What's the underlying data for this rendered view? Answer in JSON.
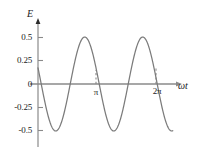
{
  "chart_data": {
    "type": "line",
    "title": "",
    "xlabel": "ωt",
    "ylabel": "E",
    "xlim": [
      0,
      7.3
    ],
    "ylim": [
      -0.62,
      0.62
    ],
    "grid": false,
    "legend": null,
    "x_ticks": [
      {
        "value": 3.14159,
        "label": "π"
      },
      {
        "value": 6.28319,
        "label": "2π"
      }
    ],
    "y_ticks": [
      {
        "value": 0.5,
        "label": "0.5"
      },
      {
        "value": 0.25,
        "label": "0.25"
      },
      {
        "value": 0.0,
        "label": "0"
      },
      {
        "value": -0.25,
        "label": "-0.25"
      },
      {
        "value": -0.5,
        "label": "-0.5"
      }
    ],
    "series": [
      {
        "name": "E",
        "color": "#7b7b7b",
        "amplitude": 0.5,
        "cycles": 2,
        "phase": -0.35,
        "expression": "E = -0.5 * sin(2*wt - 0.35)",
        "points": [
          {
            "x": 0.0,
            "y": 0.172
          },
          {
            "x": 0.1,
            "y": 0.069
          },
          {
            "x": 0.17,
            "y": 0.0
          },
          {
            "x": 0.3,
            "y": -0.126
          },
          {
            "x": 0.5,
            "y": -0.303
          },
          {
            "x": 0.7,
            "y": -0.428
          },
          {
            "x": 0.95,
            "y": -0.497
          },
          {
            "x": 1.0,
            "y": -0.5
          },
          {
            "x": 1.2,
            "y": -0.48
          },
          {
            "x": 1.4,
            "y": -0.404
          },
          {
            "x": 1.6,
            "y": -0.283
          },
          {
            "x": 1.75,
            "y": -0.166
          },
          {
            "x": 1.75,
            "y": -0.16
          },
          {
            "x": 1.92,
            "y": 0.0
          },
          {
            "x": 2.1,
            "y": 0.154
          },
          {
            "x": 2.3,
            "y": 0.304
          },
          {
            "x": 2.5,
            "y": 0.412
          },
          {
            "x": 2.75,
            "y": 0.489
          },
          {
            "x": 2.93,
            "y": 0.5
          },
          {
            "x": 3.1,
            "y": 0.485
          },
          {
            "x": 3.3,
            "y": 0.424
          },
          {
            "x": 3.5,
            "y": 0.319
          },
          {
            "x": 3.7,
            "y": 0.181
          },
          {
            "x": 3.9,
            "y": 0.025
          },
          {
            "x": 3.93,
            "y": 0.0
          },
          {
            "x": 4.1,
            "y": -0.135
          },
          {
            "x": 4.3,
            "y": -0.285
          },
          {
            "x": 4.5,
            "y": -0.401
          },
          {
            "x": 4.75,
            "y": -0.483
          },
          {
            "x": 4.93,
            "y": -0.5
          },
          {
            "x": 5.1,
            "y": -0.49
          },
          {
            "x": 5.3,
            "y": -0.437
          },
          {
            "x": 5.5,
            "y": -0.34
          },
          {
            "x": 5.7,
            "y": -0.207
          },
          {
            "x": 5.88,
            "y": -0.06
          },
          {
            "x": 5.93,
            "y": 0.0
          },
          {
            "x": 6.1,
            "y": 0.15
          },
          {
            "x": 6.3,
            "y": 0.3
          },
          {
            "x": 6.5,
            "y": 0.41
          },
          {
            "x": 6.75,
            "y": 0.487
          },
          {
            "x": 6.93,
            "y": 0.5
          },
          {
            "x": 7.1,
            "y": 0.487
          },
          {
            "x": 7.25,
            "y": 0.452
          }
        ]
      }
    ],
    "colors": {
      "curve": "#7b7b7b",
      "axis": "#8a8a8a",
      "text": "#1a1a1a",
      "background": "#ffffff",
      "tick_dash": "#8a8a8a"
    }
  }
}
